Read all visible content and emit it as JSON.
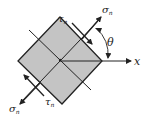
{
  "diagram": {
    "type": "stress-element",
    "element_fill": "#c4c4c4",
    "stroke_color": "#222222",
    "labels": {
      "sigma_top": {
        "symbol": "σ",
        "sub": "n"
      },
      "sigma_bottom": {
        "symbol": "σ",
        "sub": "n"
      },
      "tau_top": {
        "symbol": "τ",
        "sub": "n"
      },
      "tau_bottom": {
        "symbol": "τ",
        "sub": "n"
      },
      "theta": "θ",
      "x_axis": "x"
    }
  }
}
